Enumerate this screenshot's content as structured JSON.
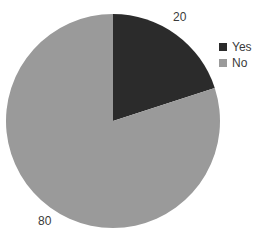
{
  "chart_data": {
    "type": "pie",
    "title": "",
    "subtitle": "",
    "xlabel": "",
    "ylabel": "",
    "categories": [
      "Yes",
      "No"
    ],
    "values": [
      20,
      80
    ],
    "slices": [
      {
        "label": "Yes",
        "value": 20,
        "value_text": "20",
        "percent": 20,
        "color": "#2b2b2b",
        "start_angle_deg": 0,
        "end_angle_deg": 72
      },
      {
        "label": "No",
        "value": 80,
        "value_text": "80",
        "percent": 80,
        "color": "#9a9a9a",
        "start_angle_deg": 72,
        "end_angle_deg": 360
      }
    ],
    "total": 100,
    "start_angle_deg": 0,
    "direction": "clockwise",
    "grid": false,
    "legend_position": "right",
    "legend": [
      {
        "label": "Yes",
        "color": "#2b2b2b"
      },
      {
        "label": "No",
        "color": "#9a9a9a"
      }
    ],
    "data_labels": [
      "20",
      "80"
    ],
    "background_color": "#ffffff",
    "label_text_color": "#3a3a3a",
    "geometry": {
      "center_x": 113,
      "center_y": 121,
      "radius": 107
    }
  }
}
